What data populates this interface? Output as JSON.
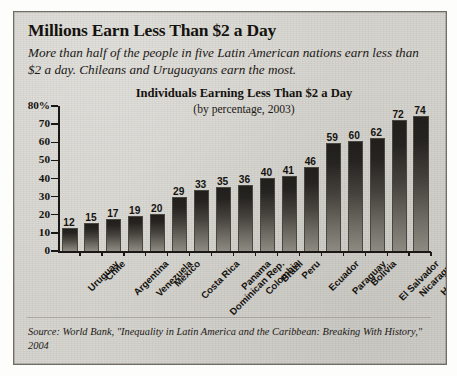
{
  "headline": "Millions Earn Less Than $2 a Day",
  "deck": "More than half of the people in five Latin American nations earn less than $2 a day. Chileans and Uruguayans earn the most.",
  "source": "Source: World Bank, \"Inequality in Latin America and the Caribbean: Breaking With History,\" 2004",
  "colors": {
    "paper": "#d6d4ce",
    "frame": "#6f6d66",
    "ink": "#15130f",
    "bar_top": "#211f1c",
    "bar_bottom": "#8d8a82"
  },
  "chart_data": {
    "type": "bar",
    "title": "Individuals Earning Less Than $2 a Day",
    "subtitle": "(by percentage, 2003)",
    "xlabel": "",
    "ylabel": "",
    "ylim": [
      0,
      80
    ],
    "yticks": [
      0,
      10,
      20,
      30,
      40,
      50,
      60,
      70,
      80
    ],
    "ytick_labels": [
      "0",
      "10",
      "20",
      "30",
      "40",
      "50",
      "60",
      "70",
      "80%"
    ],
    "grid": false,
    "legend": "none",
    "categories": [
      "Uruguay",
      "Chile",
      "Argentina",
      "Venezuela",
      "Mexico",
      "Costa Rica",
      "Dominican Rep.",
      "Panama",
      "Colombia",
      "Brazil",
      "Peru",
      "Ecuador",
      "Paraguay",
      "Bolivia",
      "El Salvador",
      "Nicaragua",
      "Honduras"
    ],
    "values": [
      12,
      15,
      17,
      19,
      20,
      29,
      33,
      35,
      36,
      40,
      41,
      46,
      59,
      60,
      62,
      72,
      74
    ]
  }
}
